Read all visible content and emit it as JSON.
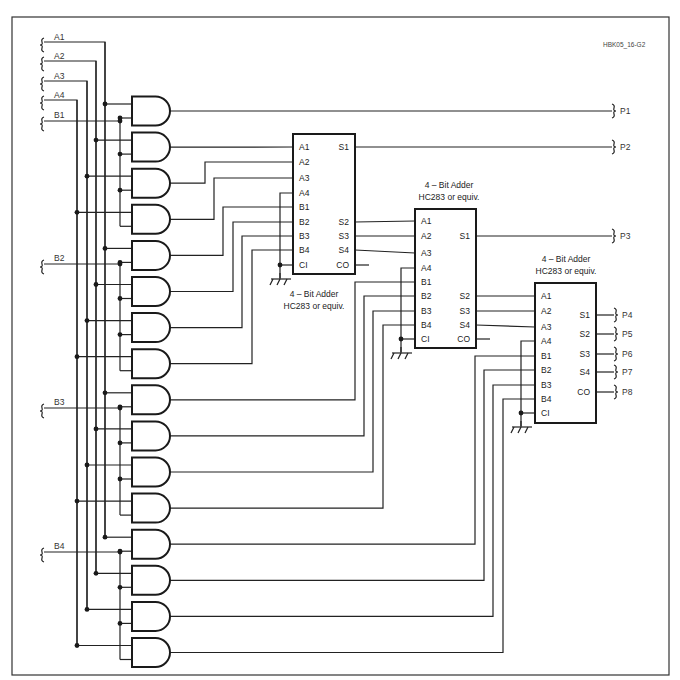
{
  "figure_id": "HBK05_16-G2",
  "inputs": [
    {
      "label": "A1",
      "y": 42,
      "x_bus": 105
    },
    {
      "label": "A2",
      "y": 61,
      "x_bus": 96
    },
    {
      "label": "A3",
      "y": 81,
      "x_bus": 87
    },
    {
      "label": "A4",
      "y": 100,
      "x_bus": 77
    }
  ],
  "b_inputs": [
    {
      "label": "B1",
      "y": 121
    },
    {
      "label": "B2",
      "y": 264
    },
    {
      "label": "B3",
      "y": 408
    },
    {
      "label": "B4",
      "y": 552
    }
  ],
  "outputs": [
    {
      "label": "P1",
      "y": 111
    },
    {
      "label": "P2",
      "y": 147
    },
    {
      "label": "P3",
      "y": 236
    },
    {
      "label": "P4",
      "y": 315
    },
    {
      "label": "P5",
      "y": 334
    },
    {
      "label": "P6",
      "y": 354
    },
    {
      "label": "P7",
      "y": 372
    },
    {
      "label": "P8",
      "y": 392
    }
  ],
  "adders": [
    {
      "name": "adder-1",
      "label1": "4  – Bit Adder",
      "label2": "HC283 or equiv.",
      "left_pins": [
        "A1",
        "A2",
        "A3",
        "A4",
        "B1",
        "B2",
        "B3",
        "B4",
        "CI"
      ],
      "right_pins": [
        "S1",
        "S2",
        "S3",
        "S4",
        "CO"
      ]
    },
    {
      "name": "adder-2",
      "label1": "4  – Bit Adder",
      "label2": "HC283 or equiv.",
      "left_pins": [
        "A1",
        "A2",
        "A3",
        "A4",
        "B1",
        "B2",
        "B3",
        "B4",
        "CI"
      ],
      "right_pins": [
        "S1",
        "S2",
        "S3",
        "S4",
        "CO"
      ]
    },
    {
      "name": "adder-3",
      "label1": "4  – Bit Adder",
      "label2": "HC283 or equiv.",
      "left_pins": [
        "A1",
        "A2",
        "A3",
        "A4",
        "B1",
        "B2",
        "B3",
        "B4",
        "CI"
      ],
      "right_pins": [
        "S1",
        "S2",
        "S3",
        "S4",
        "CO"
      ]
    }
  ],
  "gate_count": 16
}
